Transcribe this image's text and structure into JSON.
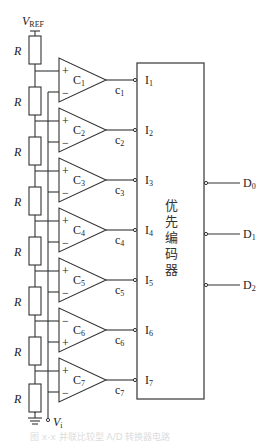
{
  "diagram": {
    "vref_label": "V",
    "vref_sub": "REF",
    "vi_label": "V",
    "vi_sub": "i",
    "resistor_label": "R",
    "resistor_count": 8,
    "encoder_label_chars": [
      "优",
      "先",
      "编",
      "码",
      "器"
    ],
    "encoder_label": "优先编码器",
    "comparators": [
      {
        "name": "C",
        "sub": "1",
        "top_sign": "+",
        "bottom_sign": "−",
        "output": "c",
        "output_sub": "1",
        "input": "I",
        "input_sub": "1"
      },
      {
        "name": "C",
        "sub": "2",
        "top_sign": "+",
        "bottom_sign": "−",
        "output": "c",
        "output_sub": "2",
        "input": "I",
        "input_sub": "2"
      },
      {
        "name": "C",
        "sub": "3",
        "top_sign": "+",
        "bottom_sign": "−",
        "output": "c",
        "output_sub": "3",
        "input": "I",
        "input_sub": "3"
      },
      {
        "name": "C",
        "sub": "4",
        "top_sign": "+",
        "bottom_sign": "−",
        "output": "c",
        "output_sub": "4",
        "input": "I",
        "input_sub": "4"
      },
      {
        "name": "C",
        "sub": "5",
        "top_sign": "+",
        "bottom_sign": "−",
        "output": "c",
        "output_sub": "5",
        "input": "I",
        "input_sub": "5"
      },
      {
        "name": "C",
        "sub": "6",
        "top_sign": "−",
        "bottom_sign": "+",
        "output": "c",
        "output_sub": "6",
        "input": "I",
        "input_sub": "6"
      },
      {
        "name": "C",
        "sub": "7",
        "top_sign": "+",
        "bottom_sign": "−",
        "output": "c",
        "output_sub": "7",
        "input": "I",
        "input_sub": "7"
      }
    ],
    "outputs": [
      {
        "name": "D",
        "sub": "0"
      },
      {
        "name": "D",
        "sub": "1"
      },
      {
        "name": "D",
        "sub": "2"
      }
    ],
    "caption": "图 x-x  并联比较型 A/D 转换器电路"
  }
}
